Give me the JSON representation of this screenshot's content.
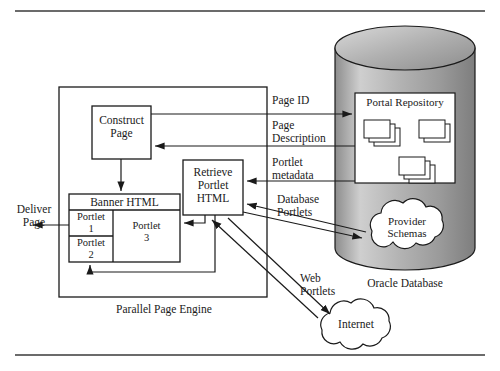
{
  "figure": {
    "rules": {
      "top_y": 11,
      "bottom_y": 355
    }
  },
  "engine": {
    "caption": "Parallel Page Engine",
    "construct_page": "Construct\nPage",
    "retrieve_portlet": "Retrieve\nPortlet\nHTML",
    "banner_header": "Banner HTML",
    "portlet_1": "Portlet\n1",
    "portlet_2": "Portlet\n2",
    "portlet_3": "Portlet\n3"
  },
  "database": {
    "caption": "Oracle Database",
    "repository_title": "Portal Repository",
    "provider_schemas": "Provider\nSchemas",
    "doc_stacks": [
      {
        "name": "stack-left",
        "layers": 3
      },
      {
        "name": "stack-right",
        "layers": 2
      },
      {
        "name": "stack-bottom",
        "layers": 3
      }
    ]
  },
  "internet": {
    "label": "Internet"
  },
  "flow_labels": {
    "deliver_page": "Deliver\nPage",
    "page_id": "Page ID",
    "page_description": "Page\nDescription",
    "portlet_metadata": "Portlet\nmetadata",
    "database_portlets": "Database\nPortlets",
    "web_portlets": "Web\nPortlets"
  },
  "colors": {
    "stroke": "#1a1a1a",
    "cylinder_light": "#e8e8e8",
    "cylinder_mid": "#b8b8b8",
    "cylinder_dark": "#8f8f8f",
    "white": "#ffffff",
    "rule": "#3a3a3a"
  }
}
